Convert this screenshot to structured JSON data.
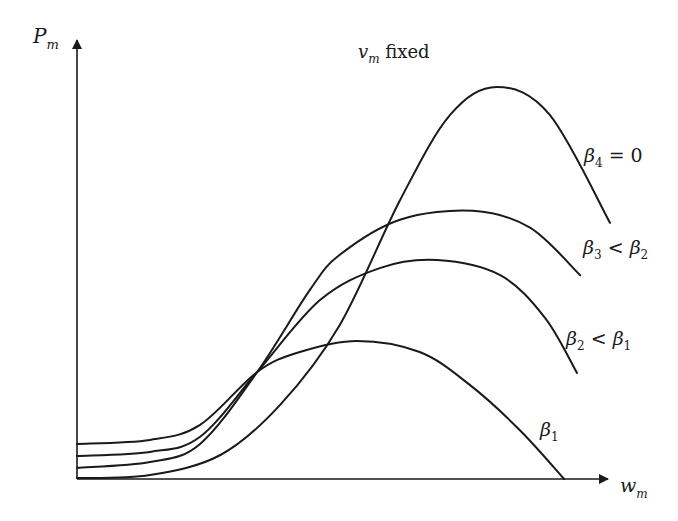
{
  "chart_data": {
    "type": "line",
    "title_parts": {
      "symbol": "v",
      "subscript": "m",
      "text": " fixed"
    },
    "xlabel": "w_m",
    "xlabel_parts": {
      "symbol": "w",
      "subscript": "m"
    },
    "ylabel": "P_m",
    "ylabel_parts": {
      "symbol": "P",
      "subscript": "m"
    },
    "xlim": [
      0,
      1
    ],
    "ylim": [
      0,
      1
    ],
    "grid": false,
    "ticks": "none",
    "series": [
      {
        "name": "β4 = 0",
        "label_parts": {
          "symbol": "β",
          "subscript": "4",
          "rest": " = 0"
        },
        "points": [
          [
            0,
            0.002
          ],
          [
            0.137,
            0.009
          ],
          [
            0.269,
            0.054
          ],
          [
            0.381,
            0.167
          ],
          [
            0.493,
            0.347
          ],
          [
            0.606,
            0.628
          ],
          [
            0.7,
            0.82
          ],
          [
            0.788,
            0.883
          ],
          [
            0.887,
            0.82
          ],
          [
            1.0,
            0.577
          ]
        ]
      },
      {
        "name": "β3 < β2",
        "label_parts": {
          "symbol": "β",
          "subscript": "3",
          "rest": " < ",
          "symbol2": "β",
          "subscript2": "2"
        },
        "points": [
          [
            0,
            0.025
          ],
          [
            0.137,
            0.038
          ],
          [
            0.231,
            0.079
          ],
          [
            0.338,
            0.241
          ],
          [
            0.437,
            0.426
          ],
          [
            0.493,
            0.505
          ],
          [
            0.606,
            0.584
          ],
          [
            0.743,
            0.604
          ],
          [
            0.85,
            0.566
          ],
          [
            0.944,
            0.459
          ]
        ]
      },
      {
        "name": "β2 < β1",
        "label_parts": {
          "symbol": "β",
          "subscript": "2",
          "rest": " < ",
          "symbol2": "β",
          "subscript2": "1"
        },
        "points": [
          [
            0,
            0.052
          ],
          [
            0.137,
            0.061
          ],
          [
            0.231,
            0.095
          ],
          [
            0.338,
            0.241
          ],
          [
            0.456,
            0.403
          ],
          [
            0.568,
            0.475
          ],
          [
            0.675,
            0.493
          ],
          [
            0.794,
            0.459
          ],
          [
            0.878,
            0.363
          ],
          [
            0.938,
            0.239
          ]
        ]
      },
      {
        "name": "β1",
        "label_parts": {
          "symbol": "β",
          "subscript": "1",
          "rest": ""
        },
        "points": [
          [
            0,
            0.079
          ],
          [
            0.137,
            0.088
          ],
          [
            0.231,
            0.122
          ],
          [
            0.338,
            0.241
          ],
          [
            0.418,
            0.286
          ],
          [
            0.525,
            0.311
          ],
          [
            0.643,
            0.286
          ],
          [
            0.737,
            0.212
          ],
          [
            0.831,
            0.11
          ],
          [
            0.914,
            0.0
          ]
        ]
      }
    ]
  }
}
